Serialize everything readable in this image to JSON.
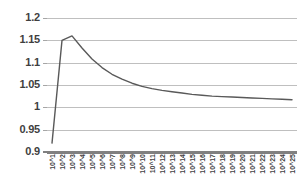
{
  "chart_data": {
    "type": "line",
    "title": "",
    "subtitle": "",
    "xlabel": "",
    "ylabel": "",
    "grid": true,
    "legend": false,
    "legend_position": "none",
    "ylim": [
      0.9,
      1.2
    ],
    "ytick_labels": [
      "1.2",
      "1.15",
      "1.1",
      "1.05",
      "1",
      "0.95",
      "0.9"
    ],
    "ytick_values": [
      1.2,
      1.15,
      1.1,
      1.05,
      1.0,
      0.95,
      0.9
    ],
    "categories": [
      "10^1",
      "10^2",
      "10^3",
      "10^4",
      "10^5",
      "10^6",
      "10^7",
      "10^8",
      "10^9",
      "10^10",
      "10^11",
      "10^12",
      "10^13",
      "10^14",
      "10^15",
      "10^16",
      "10^17",
      "10^18",
      "10^19",
      "10^20",
      "10^21",
      "10^22",
      "10^23",
      "10^24",
      "10^25"
    ],
    "series": [
      {
        "name": "series-1",
        "color": "#595959",
        "values": [
          0.92,
          1.15,
          1.16,
          1.133,
          1.108,
          1.089,
          1.074,
          1.063,
          1.054,
          1.047,
          1.042,
          1.038,
          1.035,
          1.032,
          1.029,
          1.027,
          1.025,
          1.024,
          1.023,
          1.022,
          1.021,
          1.02,
          1.019,
          1.018,
          1.017
        ]
      }
    ],
    "colors": {
      "line": "#595959",
      "gridline": "#bfbfbf",
      "axis": "#808080",
      "tick": "#a6a6a6",
      "label_text": "#3f3f3f",
      "background": "#ffffff"
    }
  }
}
